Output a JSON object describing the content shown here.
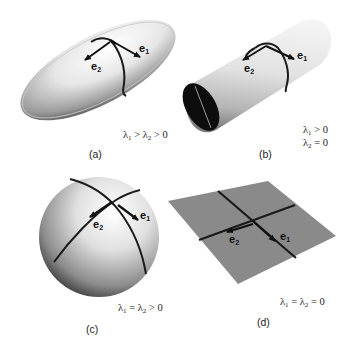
{
  "figure": {
    "panels": [
      {
        "id": "a",
        "label": "(a)",
        "shape": "ellipsoid",
        "condition_lines": [
          "λ1 > λ2 > 0"
        ],
        "condition": {
          "l1": "λ",
          "s1": "1",
          "op1": " > ",
          "l2": "λ",
          "s2": "2",
          "op2": " > 0"
        },
        "vectors": [
          {
            "name": "e",
            "sub": "1"
          },
          {
            "name": "e",
            "sub": "2"
          }
        ]
      },
      {
        "id": "b",
        "label": "(b)",
        "shape": "cylinder",
        "condition_lines": [
          "λ1 > 0",
          "λ2 = 0"
        ],
        "condition": {
          "line1": {
            "l": "λ",
            "s": "1",
            "op": " > 0"
          },
          "line2": {
            "l": "λ",
            "s": "2",
            "op": " = 0"
          }
        },
        "vectors": [
          {
            "name": "e",
            "sub": "1"
          },
          {
            "name": "e",
            "sub": "2"
          }
        ]
      },
      {
        "id": "c",
        "label": "(c)",
        "shape": "sphere",
        "condition_lines": [
          "λ1 = λ2 > 0"
        ],
        "condition": {
          "l1": "λ",
          "s1": "1",
          "op1": " = ",
          "l2": "λ",
          "s2": "2",
          "op2": " > 0"
        },
        "vectors": [
          {
            "name": "e",
            "sub": "1"
          },
          {
            "name": "e",
            "sub": "2"
          }
        ]
      },
      {
        "id": "d",
        "label": "(d)",
        "shape": "plane",
        "condition_lines": [
          "λ1 = λ2 = 0"
        ],
        "condition": {
          "l1": "λ",
          "s1": "1",
          "op1": " = ",
          "l2": "λ",
          "s2": "2",
          "op2": " = 0"
        },
        "vectors": [
          {
            "name": "e",
            "sub": "1"
          },
          {
            "name": "e",
            "sub": "2"
          }
        ]
      }
    ],
    "colors": {
      "background": "#ffffff",
      "surface_light": "#f2f2f2",
      "surface_dark": "#3a3a3a",
      "plane_fill": "#8a8a8a",
      "curve": "#1a1a1a"
    }
  }
}
